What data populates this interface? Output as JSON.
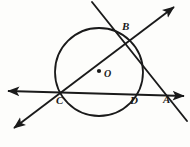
{
  "figure": {
    "kind": "circle-geometry-diagram",
    "background_color": "#fdfdfb",
    "stroke_color": "#1a1a1a",
    "circle": {
      "name": "main-circle",
      "center_label": "O",
      "center_x": 99,
      "center_y": 72,
      "radius": 44,
      "stroke_width": 1.8
    },
    "center_dot": {
      "name": "center-point-dot",
      "x": 99,
      "y": 71,
      "radius": 2.1
    },
    "labels": [
      {
        "id": "label-A",
        "text": "A",
        "x": 163,
        "y": 94
      },
      {
        "id": "label-B",
        "text": "B",
        "x": 122,
        "y": 21
      },
      {
        "id": "label-C",
        "text": "C",
        "x": 56,
        "y": 95
      },
      {
        "id": "label-D",
        "text": "D",
        "x": 130,
        "y": 95
      },
      {
        "id": "label-O",
        "text": "O",
        "x": 104,
        "y": 69
      }
    ],
    "lines": [
      {
        "id": "horizontal-secant",
        "description": "secant through C and D ending at A",
        "x1": 8,
        "y1": 91,
        "x2": 184,
        "y2": 96,
        "arrow_start": true,
        "arrow_end": true
      },
      {
        "id": "diagonal-secant-CB",
        "description": "secant through C and B",
        "x1": 14,
        "y1": 128,
        "x2": 174,
        "y2": 7,
        "arrow_start": true,
        "arrow_end": true
      },
      {
        "id": "secant-through-B-and-A",
        "description": "line from upper left through B and past A",
        "x1": 92,
        "y1": 2,
        "x2": 187,
        "y2": 121,
        "arrow_start": false,
        "arrow_end": false
      }
    ]
  }
}
